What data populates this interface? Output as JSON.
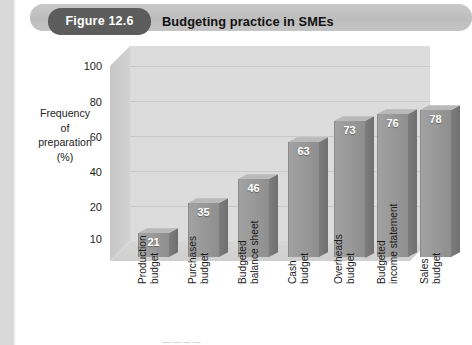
{
  "figure": {
    "label": "Figure 12.6",
    "title": "Budgeting practice in SMEs"
  },
  "colors": {
    "pill_background": "#5c5c5c",
    "banner_background": "#c4c4c4",
    "bar_front": "#949494",
    "bar_side": "#777777",
    "bar_top": "#b9b9b9",
    "back_wall": "#dcdcdc",
    "page_margin": "#d9d9d9"
  },
  "chart_data": {
    "type": "bar",
    "title": "Budgeting practice in SMEs",
    "xlabel": "",
    "ylabel": "Frequency of preparation (%)",
    "ylabel_lines": [
      "Frequency",
      "of",
      "preparation",
      "(%)"
    ],
    "categories": [
      "Production budget",
      "Purchases budget",
      "Budgeted balance sheet",
      "Cash budget",
      "Overheads budget",
      "Budgeted income statement",
      "Sales budget"
    ],
    "category_lines": [
      [
        "Production",
        "budget"
      ],
      [
        "Purchases",
        "budget"
      ],
      [
        "Budgeted",
        "balance sheet"
      ],
      [
        "Cash",
        "budget"
      ],
      [
        "Overheads",
        "budget"
      ],
      [
        "Budgeted",
        "income statement"
      ],
      [
        "Sales",
        "budget"
      ]
    ],
    "values": [
      21,
      35,
      46,
      63,
      73,
      76,
      78
    ],
    "yticks": [
      100,
      80,
      60,
      40,
      20,
      10
    ],
    "ylim": [
      10,
      100
    ],
    "grid": true,
    "legend": "none",
    "style": "3d-column"
  },
  "footer": {
    "cut_text": "— — — —"
  }
}
